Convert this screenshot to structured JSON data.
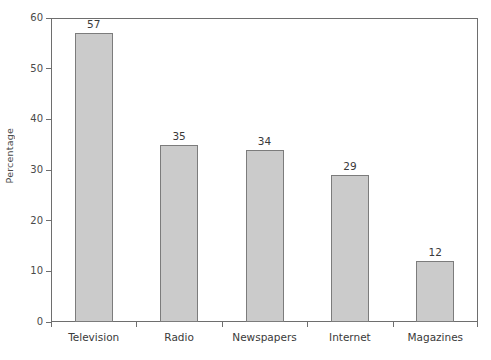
{
  "chart_data": {
    "type": "bar",
    "title": "",
    "xlabel": "",
    "ylabel": "Percentage",
    "categories": [
      "Television",
      "Radio",
      "Newspapers",
      "Internet",
      "Magazines"
    ],
    "values": [
      57,
      35,
      34,
      29,
      12
    ],
    "value_labels": [
      "57",
      "35",
      "34",
      "29",
      "12"
    ],
    "ylim": [
      0,
      60
    ],
    "ytick_labels": [
      "0",
      "10",
      "20",
      "30",
      "40",
      "50",
      "60"
    ],
    "ytick_values": [
      0,
      10,
      20,
      30,
      40,
      50,
      60
    ],
    "grid": false,
    "legend": false,
    "bar_fill_color": "#cbcbcb",
    "bar_border_color": "#7c7c7c",
    "axis_color": "#6e6e6e",
    "text_color": "#3a3a3a",
    "background_color": "#ffffff"
  }
}
